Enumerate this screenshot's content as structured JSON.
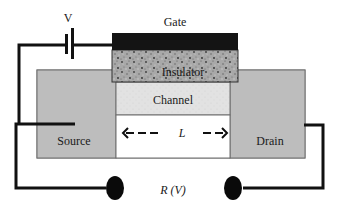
{
  "diagram": {
    "type": "field-effect transistor schematic",
    "labels": {
      "voltage": "V",
      "gate": "Gate",
      "insulator": "Insulator",
      "channel": "Channel",
      "source": "Source",
      "drain": "Drain",
      "length": "L",
      "resistance": "R (V)"
    },
    "colors": {
      "gate": "#141414",
      "insulator": "#9a9a9a",
      "channel": "#e4e4e4",
      "source_drain": "#bdbdbd",
      "wire": "#111111",
      "background": "#ffffff"
    },
    "arrow": {
      "left_dashes": "<- - -",
      "right_dashes": "- - >"
    }
  }
}
